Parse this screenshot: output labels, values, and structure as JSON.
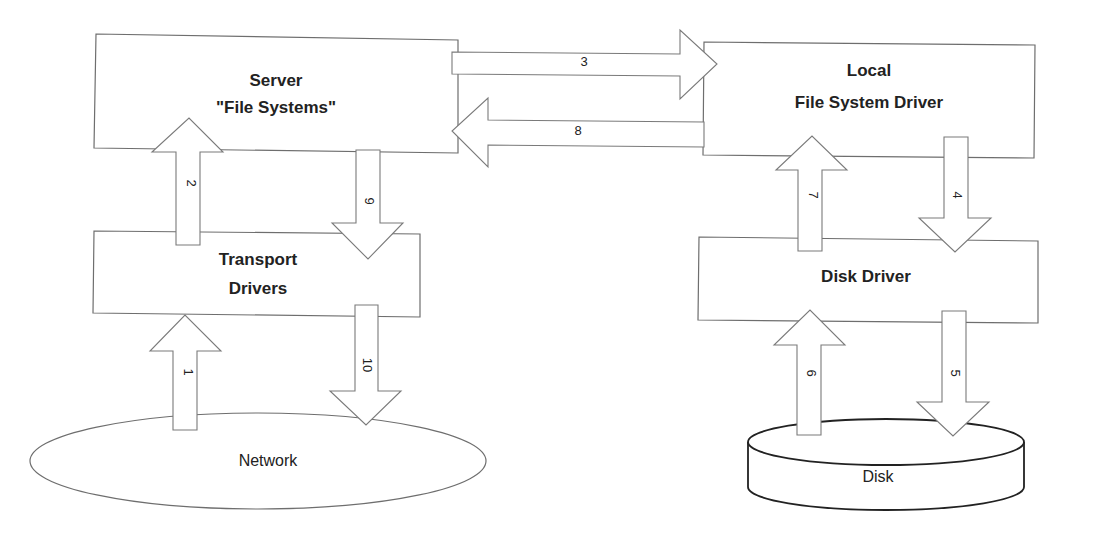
{
  "diagram": {
    "nodes": {
      "server": {
        "line1": "Server",
        "line2": "\"File Systems\""
      },
      "local_fs": {
        "line1": "Local",
        "line2": "File System Driver"
      },
      "transport": {
        "line1": "Transport",
        "line2": "Drivers"
      },
      "disk_driver": {
        "label": "Disk Driver"
      },
      "network": {
        "label": "Network"
      },
      "disk": {
        "label": "Disk"
      }
    },
    "arrows": [
      {
        "id": "1",
        "label": "1",
        "from": "Network",
        "to": "Transport Drivers"
      },
      {
        "id": "2",
        "label": "2",
        "from": "Transport Drivers",
        "to": "Server \"File Systems\""
      },
      {
        "id": "3",
        "label": "3",
        "from": "Server \"File Systems\"",
        "to": "Local File System Driver"
      },
      {
        "id": "4",
        "label": "4",
        "from": "Local File System Driver",
        "to": "Disk Driver"
      },
      {
        "id": "5",
        "label": "5",
        "from": "Disk Driver",
        "to": "Disk"
      },
      {
        "id": "6",
        "label": "6",
        "from": "Disk",
        "to": "Disk Driver"
      },
      {
        "id": "7",
        "label": "7",
        "from": "Disk Driver",
        "to": "Local File System Driver"
      },
      {
        "id": "8",
        "label": "8",
        "from": "Local File System Driver",
        "to": "Server \"File Systems\""
      },
      {
        "id": "9",
        "label": "9",
        "from": "Server \"File Systems\"",
        "to": "Transport Drivers"
      },
      {
        "id": "10",
        "label": "10",
        "from": "Transport Drivers",
        "to": "Network"
      }
    ]
  }
}
